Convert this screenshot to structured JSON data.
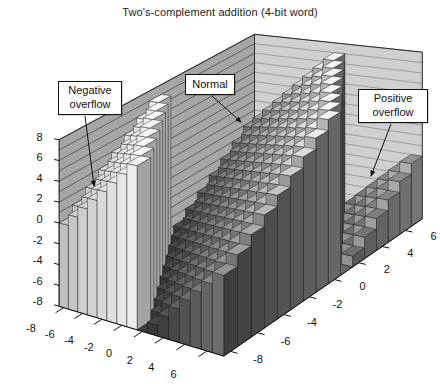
{
  "page": {
    "title": "Two's-complement addition (4-bit word)"
  },
  "chart_data": {
    "type": "bar3d",
    "title": "Two's-complement addition (4-bit word)",
    "xlabel": "",
    "ylabel": "",
    "zlabel": "",
    "x_values": [
      -8,
      -7,
      -6,
      -5,
      -4,
      -3,
      -2,
      -1,
      0,
      1,
      2,
      3,
      4,
      5,
      6,
      7
    ],
    "y_values": [
      -8,
      -7,
      -6,
      -5,
      -4,
      -3,
      -2,
      -1,
      0,
      1,
      2,
      3,
      4,
      5,
      6,
      7
    ],
    "x_ticks": [
      -8,
      -6,
      -4,
      -2,
      0,
      2,
      4,
      6
    ],
    "y_ticks": [
      -8,
      -6,
      -4,
      -2,
      0,
      2,
      4,
      6
    ],
    "z_ticks": [
      -8,
      -6,
      -4,
      -2,
      0,
      2,
      4,
      6,
      8
    ],
    "x_range": [
      -8,
      7
    ],
    "y_range": [
      -8,
      7
    ],
    "z_range": [
      -8,
      8
    ],
    "rule": "z = x + y wrapped into the 4-bit two's-complement range [-8,7]",
    "z_matrix": [
      [
        0,
        1,
        2,
        3,
        4,
        5,
        6,
        7,
        -8,
        -7,
        -6,
        -5,
        -4,
        -3,
        -2,
        -1
      ],
      [
        1,
        2,
        3,
        4,
        5,
        6,
        7,
        -8,
        -7,
        -6,
        -5,
        -4,
        -3,
        -2,
        -1,
        0
      ],
      [
        2,
        3,
        4,
        5,
        6,
        7,
        -8,
        -7,
        -6,
        -5,
        -4,
        -3,
        -2,
        -1,
        0,
        1
      ],
      [
        3,
        4,
        5,
        6,
        7,
        -8,
        -7,
        -6,
        -5,
        -4,
        -3,
        -2,
        -1,
        0,
        1,
        2
      ],
      [
        4,
        5,
        6,
        7,
        -8,
        -7,
        -6,
        -5,
        -4,
        -3,
        -2,
        -1,
        0,
        1,
        2,
        3
      ],
      [
        5,
        6,
        7,
        -8,
        -7,
        -6,
        -5,
        -4,
        -3,
        -2,
        -1,
        0,
        1,
        2,
        3,
        4
      ],
      [
        6,
        7,
        -8,
        -7,
        -6,
        -5,
        -4,
        -3,
        -2,
        -1,
        0,
        1,
        2,
        3,
        4,
        5
      ],
      [
        7,
        -8,
        -7,
        -6,
        -5,
        -4,
        -3,
        -2,
        -1,
        0,
        1,
        2,
        3,
        4,
        5,
        6
      ],
      [
        -8,
        -7,
        -6,
        -5,
        -4,
        -3,
        -2,
        -1,
        0,
        1,
        2,
        3,
        4,
        5,
        6,
        7
      ],
      [
        -7,
        -6,
        -5,
        -4,
        -3,
        -2,
        -1,
        0,
        1,
        2,
        3,
        4,
        5,
        6,
        7,
        -8
      ],
      [
        -6,
        -5,
        -4,
        -3,
        -2,
        -1,
        0,
        1,
        2,
        3,
        4,
        5,
        6,
        7,
        -8,
        -7
      ],
      [
        -5,
        -4,
        -3,
        -2,
        -1,
        0,
        1,
        2,
        3,
        4,
        5,
        6,
        7,
        -8,
        -7,
        -6
      ],
      [
        -4,
        -3,
        -2,
        -1,
        0,
        1,
        2,
        3,
        4,
        5,
        6,
        7,
        -8,
        -7,
        -6,
        -5
      ],
      [
        -3,
        -2,
        -1,
        0,
        1,
        2,
        3,
        4,
        5,
        6,
        7,
        -8,
        -7,
        -6,
        -5,
        -4
      ],
      [
        -2,
        -1,
        0,
        1,
        2,
        3,
        4,
        5,
        6,
        7,
        -8,
        -7,
        -6,
        -5,
        -4,
        -3
      ],
      [
        -1,
        0,
        1,
        2,
        3,
        4,
        5,
        6,
        7,
        -8,
        -7,
        -6,
        -5,
        -4,
        -3,
        -2
      ]
    ],
    "regions": [
      {
        "label": "Negative overflow",
        "condition": "x + y < -8"
      },
      {
        "label": "Normal",
        "condition": "-8 <= x + y <= 7"
      },
      {
        "label": "Positive overflow",
        "condition": "x + y > 7"
      }
    ],
    "annotations": [
      {
        "label": "Negative overflow",
        "box": {
          "left": 58,
          "top": 81,
          "width": 64,
          "height": 34
        },
        "arrow": {
          "x1": 85,
          "y1": 116,
          "x2": 94,
          "y2": 186
        }
      },
      {
        "label": "Normal",
        "box": {
          "left": 185,
          "top": 74,
          "width": 50,
          "height": 21
        },
        "arrow": {
          "x1": 212,
          "y1": 96,
          "x2": 241,
          "y2": 122
        }
      },
      {
        "label": "Positive overflow",
        "box": {
          "left": 358,
          "top": 89,
          "width": 70,
          "height": 34
        },
        "arrow": {
          "x1": 391,
          "y1": 124,
          "x2": 371,
          "y2": 176
        }
      }
    ],
    "legend_position": "none",
    "grid": true,
    "colors": {
      "background": "#ffffff",
      "left_wall": "#a6a6a6",
      "right_wall": "#d0d0d0",
      "left_wall_line": "#4e4e4e",
      "right_wall_line": "#8f8f8f",
      "floor": "#4a4a4a",
      "edge": "#1d1d1d",
      "text": "#111111"
    }
  }
}
